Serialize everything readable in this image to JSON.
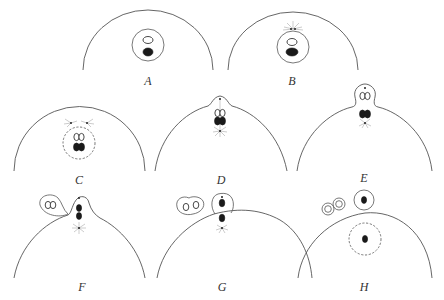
{
  "figure": {
    "panels": [
      {
        "id": "A",
        "label": "A"
      },
      {
        "id": "B",
        "label": "B"
      },
      {
        "id": "C",
        "label": "C"
      },
      {
        "id": "D",
        "label": "D"
      },
      {
        "id": "E",
        "label": "E"
      },
      {
        "id": "F",
        "label": "F"
      },
      {
        "id": "G",
        "label": "G"
      },
      {
        "id": "H",
        "label": "H"
      }
    ]
  },
  "colors": {
    "background": "#ffffff",
    "line": "#555555",
    "chromatin": "#1a1a1a",
    "aster": "#999999"
  }
}
